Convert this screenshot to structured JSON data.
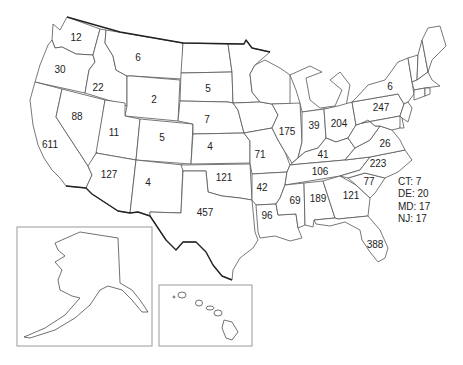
{
  "map": {
    "type": "choropleth-count-map",
    "region": "United States",
    "states": [
      {
        "id": "WA",
        "value": "12",
        "x": 76,
        "y": 38
      },
      {
        "id": "OR",
        "value": "30",
        "x": 60,
        "y": 70
      },
      {
        "id": "ID",
        "value": "22",
        "x": 98,
        "y": 88
      },
      {
        "id": "MT",
        "value": "6",
        "x": 138,
        "y": 58
      },
      {
        "id": "WY",
        "value": "2",
        "x": 154,
        "y": 100
      },
      {
        "id": "SD",
        "value": "5",
        "x": 208,
        "y": 89
      },
      {
        "id": "NE",
        "value": "7",
        "x": 207,
        "y": 120
      },
      {
        "id": "NV",
        "value": "88",
        "x": 77,
        "y": 117
      },
      {
        "id": "UT",
        "value": "11",
        "x": 114,
        "y": 133
      },
      {
        "id": "CO",
        "value": "5",
        "x": 162,
        "y": 138
      },
      {
        "id": "KS",
        "value": "4",
        "x": 210,
        "y": 147
      },
      {
        "id": "CA",
        "value": "611",
        "x": 50,
        "y": 145
      },
      {
        "id": "AZ",
        "value": "127",
        "x": 109,
        "y": 175
      },
      {
        "id": "NM",
        "value": "4",
        "x": 148,
        "y": 183
      },
      {
        "id": "OK",
        "value": "121",
        "x": 224,
        "y": 178
      },
      {
        "id": "TX",
        "value": "457",
        "x": 205,
        "y": 213
      },
      {
        "id": "MO",
        "value": "71",
        "x": 260,
        "y": 155
      },
      {
        "id": "AR",
        "value": "42",
        "x": 262,
        "y": 188
      },
      {
        "id": "LA",
        "value": "96",
        "x": 267,
        "y": 216
      },
      {
        "id": "IL",
        "value": "175",
        "x": 287,
        "y": 132
      },
      {
        "id": "IN",
        "value": "39",
        "x": 314,
        "y": 126
      },
      {
        "id": "OH",
        "value": "204",
        "x": 339,
        "y": 124
      },
      {
        "id": "KY",
        "value": "41",
        "x": 323,
        "y": 155
      },
      {
        "id": "TN",
        "value": "106",
        "x": 320,
        "y": 172
      },
      {
        "id": "MS",
        "value": "69",
        "x": 295,
        "y": 201
      },
      {
        "id": "AL",
        "value": "189",
        "x": 318,
        "y": 199
      },
      {
        "id": "GA",
        "value": "121",
        "x": 351,
        "y": 196
      },
      {
        "id": "FL",
        "value": "388",
        "x": 375,
        "y": 245
      },
      {
        "id": "SC",
        "value": "77",
        "x": 369,
        "y": 182
      },
      {
        "id": "NC",
        "value": "223",
        "x": 378,
        "y": 164
      },
      {
        "id": "VA",
        "value": "26",
        "x": 385,
        "y": 144
      },
      {
        "id": "PA",
        "value": "247",
        "x": 381,
        "y": 108
      },
      {
        "id": "NY",
        "value": "6",
        "x": 390,
        "y": 87
      }
    ],
    "legend": [
      {
        "label": "CT: 7"
      },
      {
        "label": "DE: 20"
      },
      {
        "label": "MD: 17"
      },
      {
        "label": "NJ: 17"
      }
    ],
    "insets": [
      {
        "id": "alaska",
        "label": "AK"
      },
      {
        "id": "hawaii",
        "label": "HI"
      }
    ],
    "colors": {
      "state_fill": "#ffffff",
      "state_border": "#555555",
      "national_border": "#222222",
      "inset_border": "#9a9a9a",
      "text": "#222222"
    }
  }
}
